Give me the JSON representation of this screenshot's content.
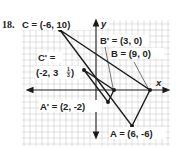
{
  "problem_number": "18.",
  "axes": {
    "x_label": "x",
    "y_label": "y"
  },
  "points": {
    "C": {
      "name": "C",
      "coords": "(-6, 10)",
      "x": -6,
      "y": 10
    },
    "B": {
      "name": "B",
      "coords": "(9, 0)",
      "x": 9,
      "y": 0
    },
    "A": {
      "name": "A",
      "coords": "(6, -6)",
      "x": 6,
      "y": -6
    },
    "C_prime": {
      "name": "C'",
      "coords_line1": "=",
      "coords": "(-2, 3",
      "frac_num": "1",
      "frac_den": "3",
      "coords_close": ")",
      "x": -2,
      "y": 3.333
    },
    "B_prime": {
      "name": "B'",
      "coords": "(3, 0)",
      "x": 3,
      "y": 0
    },
    "A_prime": {
      "name": "A'",
      "coords": "(2, -2)",
      "x": 2,
      "y": -2
    }
  },
  "labels": {
    "C": "C = (-6, 10)",
    "B_prime": "B' = (3, 0)",
    "B": "B = (9, 0)",
    "C_prime_1": "C' =",
    "C_prime_2": "(-2, 3",
    "C_prime_frac_num": "1",
    "C_prime_frac_den": "3",
    "C_prime_close": ")",
    "A_prime": "A' = (2, -2)",
    "A": "A = (6, -6)"
  },
  "colors": {
    "grid": "#c9c9c9",
    "ink": "#1a1a1a"
  }
}
